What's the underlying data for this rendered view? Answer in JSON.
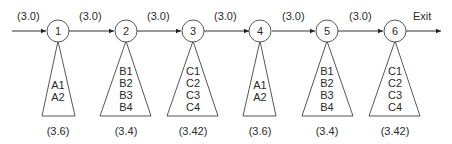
{
  "diagram": {
    "entry_label": "(3.0)",
    "exit_label": "Exit",
    "edge_labels": [
      "(3.0)",
      "(3.0)",
      "(3.0)",
      "(3.0)",
      "(3.0)"
    ],
    "nodes": [
      {
        "id": "1",
        "items": [
          "A1",
          "A2"
        ],
        "value": "(3.6)"
      },
      {
        "id": "2",
        "items": [
          "B1",
          "B2",
          "B3",
          "B4"
        ],
        "value": "(3.4)"
      },
      {
        "id": "3",
        "items": [
          "C1",
          "C2",
          "C3",
          "C4"
        ],
        "value": "(3.42)"
      },
      {
        "id": "4",
        "items": [
          "A1",
          "A2"
        ],
        "value": "(3.6)"
      },
      {
        "id": "5",
        "items": [
          "B1",
          "B2",
          "B3",
          "B4"
        ],
        "value": "(3.4)"
      },
      {
        "id": "6",
        "items": [
          "C1",
          "C2",
          "C3",
          "C4"
        ],
        "value": "(3.42)"
      }
    ]
  }
}
